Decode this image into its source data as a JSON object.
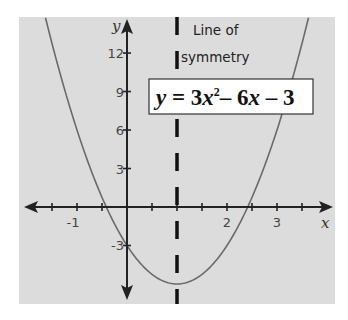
{
  "chart_data": {
    "type": "line",
    "title": "",
    "equation": "y = 3x^2 - 6x - 3",
    "equation_parts": {
      "y": "y",
      "eq": " = 3",
      "x1": "x",
      "sup": "2",
      "mid": "– 6",
      "x2": "x",
      "end": " – 3"
    },
    "series": [
      {
        "name": "y = 3x^2 - 6x - 3",
        "function": "3x^2-6x-3",
        "x_range": [
          -1.63,
          3.63
        ],
        "vertex": [
          1,
          -6
        ]
      }
    ],
    "xlabel": "x",
    "ylabel": "y",
    "x_ticks": [
      {
        "value": -1,
        "label": "-1"
      },
      {
        "value": 2,
        "label": "2"
      },
      {
        "value": 3,
        "label": "3"
      }
    ],
    "y_ticks": [
      {
        "value": 12,
        "label": "12"
      },
      {
        "value": 9,
        "label": "9"
      },
      {
        "value": 6,
        "label": "6"
      },
      {
        "value": 3,
        "label": "3"
      },
      {
        "value": -3,
        "label": "-3"
      }
    ],
    "xlim": [
      -2.2,
      4.2
    ],
    "ylim": [
      -7.5,
      14.8
    ],
    "annotations": [
      {
        "text_line1": "Line of",
        "text_line2": "symmetry",
        "x": 1,
        "style": "dashed vertical line"
      }
    ],
    "grid": false,
    "colors": {
      "background": "#dcdcdc",
      "curve": "#666666",
      "axes": "#222222",
      "symmetry": "#111111"
    }
  }
}
